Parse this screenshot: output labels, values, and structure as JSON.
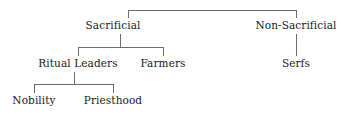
{
  "diagram": {
    "type": "hierarchy-tree",
    "orientation": "top-down",
    "background_color": "#ffffff",
    "line_color": "#6d6d6d",
    "text_color": "#1a1a1a",
    "nodes": {
      "sacrificial": "Sacrificial",
      "non_sacrificial": "Non-Sacrificial",
      "ritual_leaders": "Ritual Leaders",
      "farmers": "Farmers",
      "serfs": "Serfs",
      "nobility": "Nobility",
      "priesthood": "Priesthood"
    },
    "levels": [
      [
        "Sacrificial",
        "Non-Sacrificial"
      ],
      [
        "Ritual Leaders",
        "Farmers",
        "Serfs"
      ],
      [
        "Nobility",
        "Priesthood"
      ]
    ],
    "edges": [
      {
        "from": "root",
        "to": "Sacrificial"
      },
      {
        "from": "root",
        "to": "Non-Sacrificial"
      },
      {
        "from": "Sacrificial",
        "to": "Ritual Leaders"
      },
      {
        "from": "Sacrificial",
        "to": "Farmers"
      },
      {
        "from": "Non-Sacrificial",
        "to": "Serfs"
      },
      {
        "from": "Ritual Leaders",
        "to": "Nobility"
      },
      {
        "from": "Ritual Leaders",
        "to": "Priesthood"
      }
    ]
  }
}
